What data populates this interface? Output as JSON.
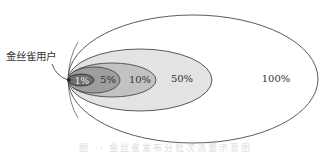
{
  "diagram": {
    "type": "nested-ellipses",
    "pointer_label": "金丝雀用户",
    "rings": [
      {
        "label": "100%",
        "fill": "#ffffff",
        "cx": 193,
        "cy": 79,
        "rx": 125,
        "ry": 64,
        "label_x": 276,
        "label_y": 82
      },
      {
        "label": "50%",
        "fill": "#e3e3e3",
        "cx": 140,
        "cy": 80,
        "rx": 72,
        "ry": 31,
        "label_x": 182,
        "label_y": 82
      },
      {
        "label": "10%",
        "fill": "#c2c2c2",
        "cx": 112,
        "cy": 80,
        "rx": 44,
        "ry": 17,
        "label_x": 138,
        "label_y": 82
      },
      {
        "label": "5%",
        "fill": "#9e9e9e",
        "cx": 94,
        "cy": 80,
        "rx": 26,
        "ry": 13,
        "label_x": 106,
        "label_y": 82
      },
      {
        "label": "1%",
        "fill": "#6e6e6e",
        "cx": 81,
        "cy": 80,
        "rx": 13,
        "ry": 6,
        "label_x": 81,
        "label_y": 83
      }
    ],
    "stroke_color": "#4a4a4a",
    "caption": "图 ·· 金丝雀发布分批次流量示意图"
  }
}
